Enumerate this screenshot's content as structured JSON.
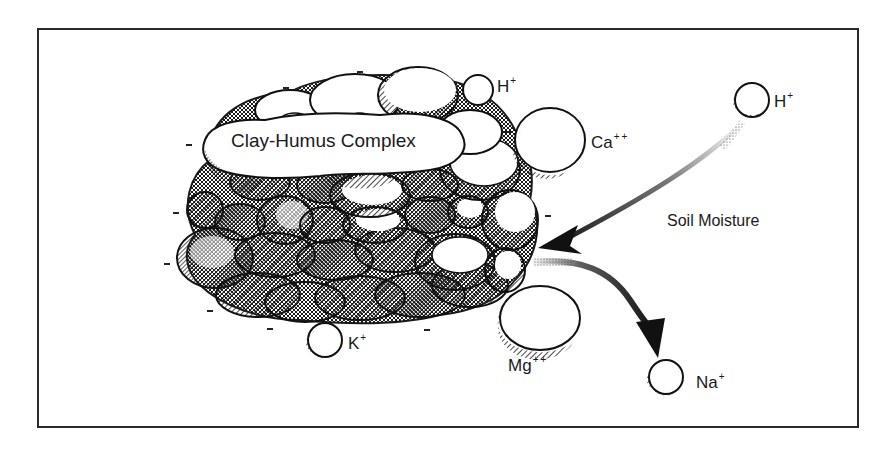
{
  "diagram": {
    "title": "Clay-Humus Complex",
    "process_label": "Soil Moisture",
    "colors": {
      "ink": "#1a1a1a",
      "background": "#ffffff",
      "frame": "#2a2a2a"
    },
    "ions": {
      "h_top": {
        "symbol": "H",
        "charge": "+"
      },
      "h_right": {
        "symbol": "H",
        "charge": "+"
      },
      "ca": {
        "symbol": "Ca",
        "charge": "++"
      },
      "mg": {
        "symbol": "Mg",
        "charge": "++"
      },
      "k": {
        "symbol": "K",
        "charge": "+"
      },
      "na": {
        "symbol": "Na",
        "charge": "+"
      }
    },
    "negative_charge_marker": "-",
    "arrows": [
      {
        "name": "incoming-arrow",
        "from": "H+ (soil moisture)",
        "to": "Clay-Humus Complex"
      },
      {
        "name": "outgoing-arrow",
        "from": "Clay-Humus Complex",
        "to": "Na+"
      }
    ]
  }
}
